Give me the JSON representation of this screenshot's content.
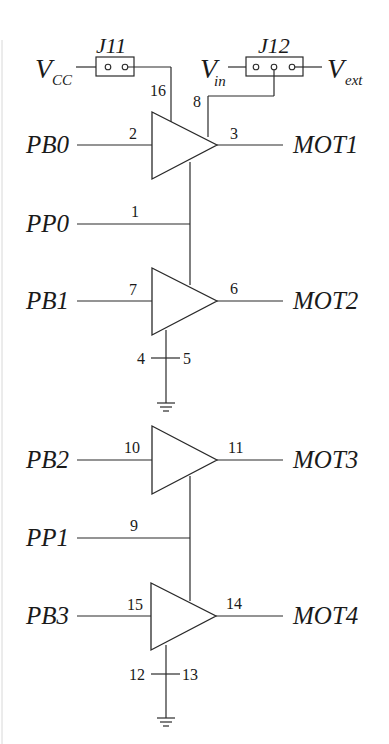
{
  "diagram": {
    "type": "circuit-schematic",
    "jumpers": [
      {
        "id": "J11",
        "label": "J11",
        "pins": 2,
        "left_net": {
          "symbol": "V",
          "subscript": "CC"
        }
      },
      {
        "id": "J12",
        "label": "J12",
        "pins": 3,
        "left_net": {
          "symbol": "V",
          "subscript": "in"
        },
        "right_net": {
          "symbol": "V",
          "subscript": "ext"
        }
      }
    ],
    "supply_pins": {
      "vcc_pin": "16",
      "vmotor_pin": "8"
    },
    "drivers": [
      {
        "input": "PB0",
        "input_pin": "2",
        "output_pin": "3",
        "output": "MOT1"
      },
      {
        "input": "PB1",
        "input_pin": "7",
        "output_pin": "6",
        "output": "MOT2"
      },
      {
        "input": "PB2",
        "input_pin": "10",
        "output_pin": "11",
        "output": "MOT3"
      },
      {
        "input": "PB3",
        "input_pin": "15",
        "output_pin": "14",
        "output": "MOT4"
      }
    ],
    "enables": [
      {
        "signal": "PP0",
        "pin": "1"
      },
      {
        "signal": "PP1",
        "pin": "9"
      }
    ],
    "grounds": [
      {
        "left_pin": "4",
        "right_pin": "5"
      },
      {
        "left_pin": "12",
        "right_pin": "13"
      }
    ]
  }
}
